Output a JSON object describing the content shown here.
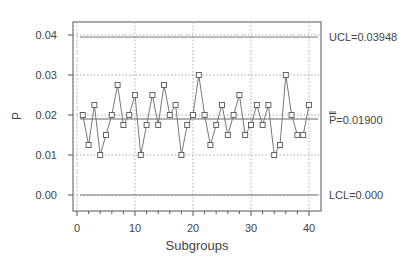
{
  "chart_data": {
    "type": "line",
    "title": "",
    "xlabel": "Subgroups",
    "ylabel": "P",
    "xlim": [
      0,
      40
    ],
    "ylim": [
      0.0,
      0.04
    ],
    "x_ticks": [
      0,
      10,
      20,
      30,
      40
    ],
    "x_tick_labels": [
      "0",
      "10",
      "20",
      "30",
      "40"
    ],
    "y_ticks": [
      0.0,
      0.01,
      0.02,
      0.03,
      0.04
    ],
    "y_tick_labels": [
      "0.00",
      "0.01",
      "0.02",
      "0.03",
      "0.04"
    ],
    "grid": true,
    "x": [
      1,
      2,
      3,
      4,
      5,
      6,
      7,
      8,
      9,
      10,
      11,
      12,
      13,
      14,
      15,
      16,
      17,
      18,
      19,
      20,
      21,
      22,
      23,
      24,
      25,
      26,
      27,
      28,
      29,
      30,
      31,
      32,
      33,
      34,
      35,
      36,
      37,
      38,
      39,
      40
    ],
    "series": [
      {
        "name": "P",
        "marker": "square",
        "values": [
          0.02,
          0.0125,
          0.0225,
          0.01,
          0.015,
          0.02,
          0.0275,
          0.0175,
          0.02,
          0.025,
          0.01,
          0.0175,
          0.025,
          0.0175,
          0.0275,
          0.02,
          0.0225,
          0.01,
          0.0175,
          0.02,
          0.03,
          0.02,
          0.0125,
          0.0175,
          0.0225,
          0.015,
          0.02,
          0.025,
          0.015,
          0.0175,
          0.0225,
          0.0175,
          0.0225,
          0.01,
          0.0125,
          0.03,
          0.02,
          0.015,
          0.015,
          0.0225
        ]
      }
    ],
    "control_limits": {
      "ucl": {
        "value": 0.03948,
        "label": "UCL=0.03948"
      },
      "center": {
        "value": 0.019,
        "label_symbol": "P",
        "label_value": "=0.01900"
      },
      "lcl": {
        "value": 0.0,
        "label": "LCL=0.000"
      }
    },
    "legend": "none",
    "colors": {
      "line": "#777777",
      "marker_edge": "#555555",
      "grid": "#aaaaaa",
      "axis": "#555555",
      "text": "#444444"
    }
  }
}
